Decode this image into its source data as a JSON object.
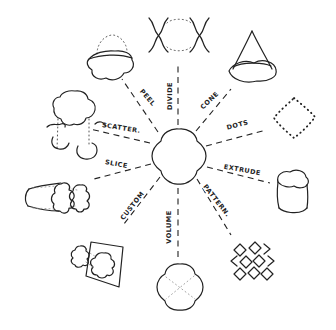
{
  "diagram": {
    "spokes": [
      {
        "id": "peel",
        "label": "PEEL"
      },
      {
        "id": "divide",
        "label": "DIVIDE"
      },
      {
        "id": "cone",
        "label": "CONE"
      },
      {
        "id": "dots",
        "label": "DOTS"
      },
      {
        "id": "extrude",
        "label": "EXTRUDE"
      },
      {
        "id": "pattern",
        "label": "PATTERN."
      },
      {
        "id": "volume",
        "label": "VOLUME"
      },
      {
        "id": "custom",
        "label": "CUSTOM"
      },
      {
        "id": "slice",
        "label": "SLICE"
      },
      {
        "id": "scatter",
        "label": "SCATTER."
      }
    ],
    "colors": {
      "ink": "#222222",
      "background": "#ffffff",
      "faint": "#9a9a9a"
    }
  }
}
